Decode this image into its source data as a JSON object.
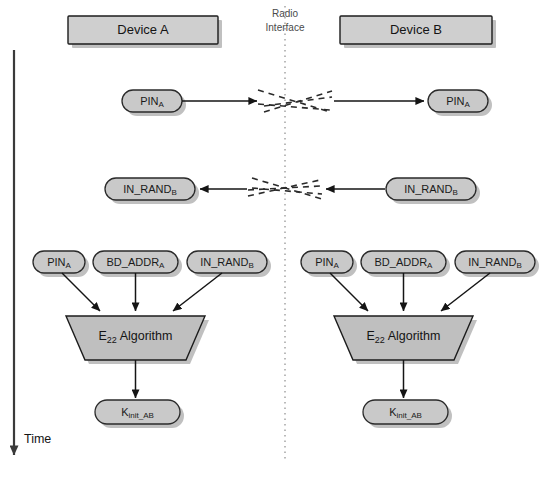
{
  "figure": {
    "background_color": "#ffffff"
  },
  "colors": {
    "box_fill": "#cfcfcf",
    "pill_fill": "#c9c9c9",
    "trapezoid_fill": "#bfbfbf",
    "outline": "#1c1c1c",
    "shadow": "#9a9a9a",
    "connector": "#151515",
    "interface_line": "#8d8d8d",
    "axis": "#3a3a3a"
  },
  "headers": {
    "device_a": "Device A",
    "device_b": "Device B",
    "radio_interface_line1": "Radio",
    "radio_interface_line2": "Interface"
  },
  "axis": {
    "label": "Time",
    "direction": "downward"
  },
  "exchange_1": {
    "direction": "a-to-b",
    "source_label_main": "PIN",
    "source_label_sub": "A",
    "target_label_main": "PIN",
    "target_label_sub": "A"
  },
  "exchange_2": {
    "direction": "b-to-a",
    "source_label_main": "IN_RAND",
    "source_label_sub": "B",
    "target_label_main": "IN_RAND",
    "target_label_sub": "B"
  },
  "device_a_block": {
    "inputs": [
      {
        "main": "PIN",
        "sub": "A"
      },
      {
        "main": "BD_ADDR",
        "sub": "A"
      },
      {
        "main": "IN_RAND",
        "sub": "B"
      }
    ],
    "algorithm": {
      "main": "E",
      "sub": "22",
      "suffix": " Algorithm"
    },
    "output": {
      "main": "K",
      "sub": "init_AB"
    }
  },
  "device_b_block": {
    "inputs": [
      {
        "main": "PIN",
        "sub": "A"
      },
      {
        "main": "BD_ADDR",
        "sub": "A"
      },
      {
        "main": "IN_RAND",
        "sub": "B"
      }
    ],
    "algorithm": {
      "main": "E",
      "sub": "22",
      "suffix": " Algorithm"
    },
    "output": {
      "main": "K",
      "sub": "init_AB"
    }
  }
}
